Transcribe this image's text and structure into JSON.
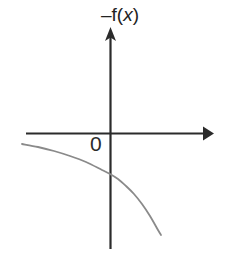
{
  "figure": {
    "background_color": "#ffffff",
    "width": 237,
    "height": 260,
    "axis_color": "#2b2b2b",
    "curve_color": "#8a8a8a",
    "label_color": "#222222"
  },
  "labels": {
    "function_label_prefix": "–f(",
    "function_label_variable": "x",
    "function_label_suffix": ")",
    "function_label_full": "–f(x)",
    "origin_label": "0"
  },
  "chart_data": {
    "type": "line",
    "title": "–f(x)",
    "xlabel": "",
    "ylabel": "",
    "grid": false,
    "legend": null,
    "axes": {
      "x_axis": {
        "pixel_y": 133,
        "pixel_x_start": 26,
        "pixel_x_end": 213,
        "arrow": "right",
        "ticks": [],
        "tick_labels": []
      },
      "y_axis": {
        "pixel_x": 110,
        "pixel_y_start": 28,
        "pixel_y_end": 249,
        "arrow": "up",
        "ticks": [],
        "tick_labels": []
      },
      "origin": {
        "pixel_x": 110,
        "pixel_y": 133,
        "label": "0"
      }
    },
    "series": [
      {
        "name": "–f(x)",
        "color": "#8a8a8a",
        "description": "Negative, concave-down decreasing curve; reflection of an increasing exponential about the x-axis. Approaches the x-axis from below on the left and falls steeply to the right.",
        "points_pixel": [
          [
            22,
            144
          ],
          [
            38,
            147
          ],
          [
            54,
            151
          ],
          [
            70,
            156
          ],
          [
            86,
            162
          ],
          [
            102,
            170
          ],
          [
            110,
            174
          ],
          [
            118,
            179
          ],
          [
            126,
            186
          ],
          [
            134,
            194
          ],
          [
            142,
            204
          ],
          [
            150,
            216
          ],
          [
            158,
            230
          ],
          [
            161,
            235
          ]
        ]
      }
    ]
  }
}
